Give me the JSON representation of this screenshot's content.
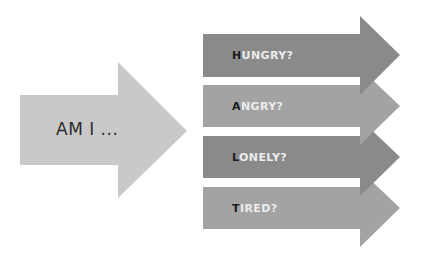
{
  "main_arrow": {
    "label": "AM I ...",
    "color": "#c9c9c9"
  },
  "arrows": [
    {
      "first": "H",
      "rest": "UNGRY?",
      "color": "#8a8a8a"
    },
    {
      "first": "A",
      "rest": "NGRY?",
      "color": "#a3a3a3"
    },
    {
      "first": "L",
      "rest": "ONELY?",
      "color": "#8a8a8a"
    },
    {
      "first": "T",
      "rest": "IRED?",
      "color": "#a3a3a3"
    }
  ]
}
